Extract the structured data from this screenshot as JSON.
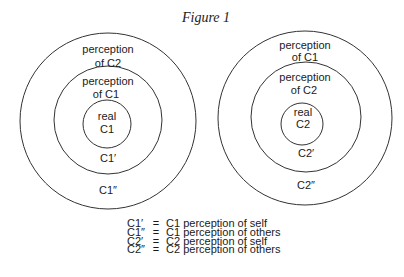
{
  "figure": {
    "title": "Figure 1",
    "diagrams": [
      {
        "id": "c1",
        "rings": [
          {
            "level": "outer",
            "lines": [
              "perception",
              "of C2"
            ],
            "bottom_label": "C1″"
          },
          {
            "level": "middle",
            "lines": [
              "perception",
              "of C1"
            ],
            "bottom_label": "C1′"
          },
          {
            "level": "inner",
            "lines": [
              "real",
              "C1"
            ]
          }
        ]
      },
      {
        "id": "c2",
        "rings": [
          {
            "level": "outer",
            "lines": [
              "perception",
              "of C1"
            ],
            "bottom_label": "C2″"
          },
          {
            "level": "middle",
            "lines": [
              "perception",
              "of C2"
            ],
            "bottom_label": "C2′"
          },
          {
            "level": "inner",
            "lines": [
              "real",
              "C2"
            ]
          }
        ]
      }
    ],
    "legend": [
      {
        "key": "C1′",
        "eq": "=",
        "desc": "C1 perception of self"
      },
      {
        "key": "C1″",
        "eq": "=",
        "desc": "C1 perception of others"
      },
      {
        "key": "C2′",
        "eq": "=",
        "desc": "C2 perception of self"
      },
      {
        "key": "C2″",
        "eq": "=",
        "desc": "C2 perception of others"
      }
    ]
  }
}
